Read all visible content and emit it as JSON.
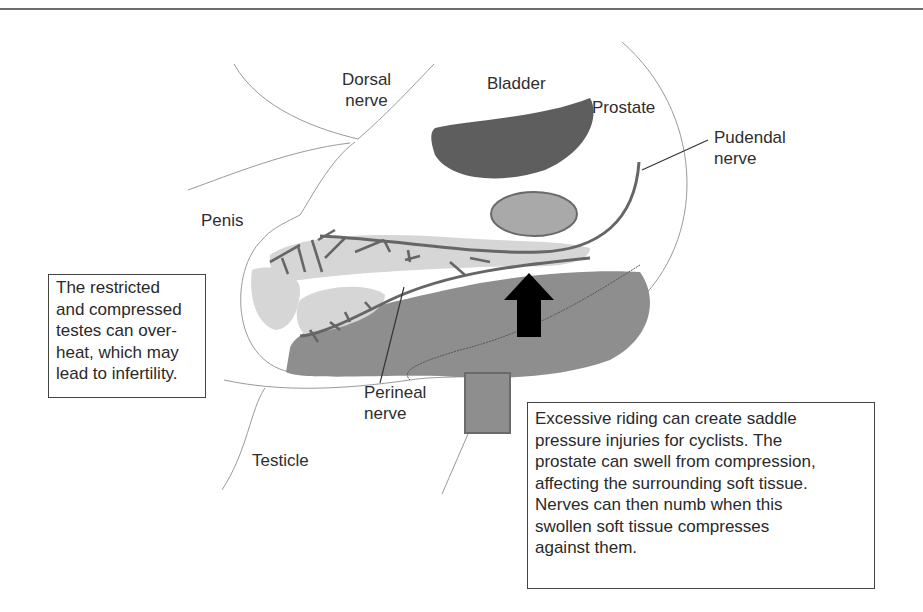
{
  "diagram": {
    "labels": {
      "dorsal_nerve": [
        "Dorsal",
        "nerve"
      ],
      "bladder": "Bladder",
      "prostate": "Prostate",
      "pudendal_nerve": [
        "Pudendal",
        "nerve"
      ],
      "penis": "Penis",
      "perineal_nerve": [
        "Perineal",
        "nerve"
      ],
      "testicle": "Testicle"
    },
    "notes": {
      "testes": [
        "The restricted",
        "and compressed",
        "testes can over-",
        "heat, which may",
        "lead to infertility."
      ],
      "saddle": [
        "Excessive riding can create saddle",
        "pressure injuries for cyclists. The",
        "prostate can swell from compression,",
        "affecting the surrounding soft tissue.",
        "Nerves can then numb when this",
        "swollen soft tissue compresses",
        "against them."
      ]
    },
    "icons": {
      "pressure_arrow": "up-arrow",
      "saddle": "square"
    },
    "colors": {
      "bladder": "#5e5e5e",
      "prostate": "#a9a9a9",
      "erectile_tissue": "#d6d6d6",
      "soft_tissue": "#8e8e8e",
      "nerve": "#666666",
      "arrow": "#000000",
      "outline": "#9a9a9a"
    }
  }
}
